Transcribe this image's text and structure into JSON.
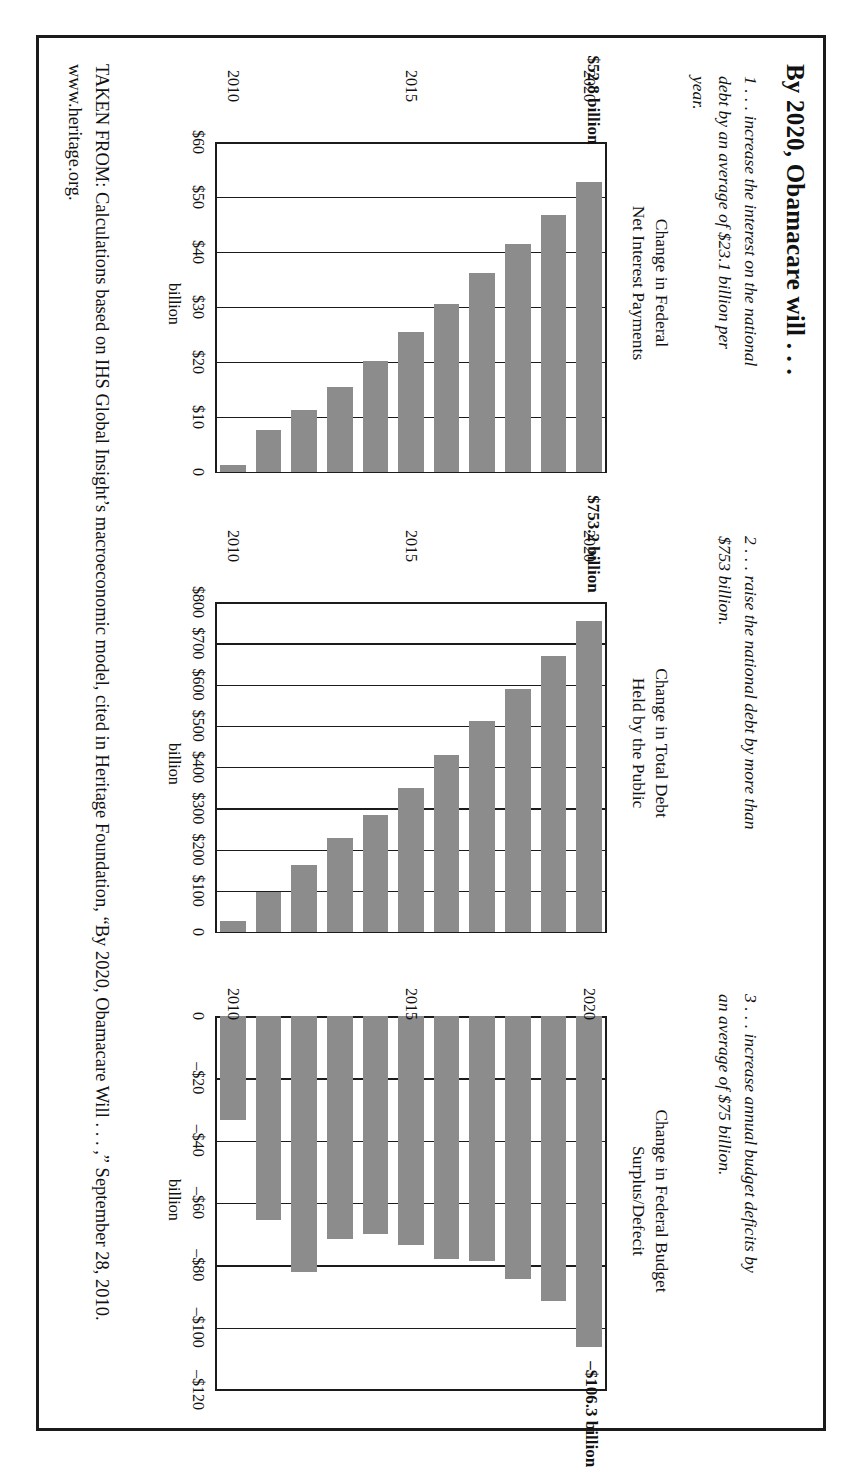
{
  "document": {
    "title": "By 2020, Obamacare will . . .",
    "claims": [
      "1 . . . increase the interest on the national debt by an average of $23.1 billion per year.",
      "2 . . . raise the national debt by more than $753 billion.",
      "3 . . . increase annual budget deficits by an average of $75 billion."
    ],
    "source": "TAKEN FROM: Calculations based on IHS Global Insight’s macroeconomic model, cited in Heritage Foundation, “By 2020, Obamacare Will . . . ,” September 28, 2010. www.heritage.org."
  },
  "chart_data": [
    {
      "id": "chart-1",
      "type": "bar",
      "orientation": "vertical",
      "title": "Change in Federal\nNet Interest Payments",
      "title_line1": "Change in Federal",
      "title_line2": "Net Interest Payments",
      "annotation": "$52.8 billion",
      "ylabel": "billion",
      "xlabel": "",
      "categories": [
        "2010",
        "2011",
        "2012",
        "2013",
        "2014",
        "2015",
        "2016",
        "2017",
        "2018",
        "2019",
        "2020"
      ],
      "xtick_labels": [
        "2010",
        "2015",
        "2020"
      ],
      "ytick_labels": [
        "$60",
        "$50",
        "$40",
        "$30",
        "$20",
        "$10",
        "0"
      ],
      "ytick_values": [
        60,
        50,
        40,
        30,
        20,
        10,
        0
      ],
      "ylim": [
        0,
        60
      ],
      "grid": true,
      "values": [
        1.2,
        7.6,
        11.3,
        15.4,
        20.1,
        25.4,
        30.6,
        36.2,
        41.5,
        46.8,
        52.8
      ]
    },
    {
      "id": "chart-2",
      "type": "bar",
      "orientation": "vertical",
      "title": "Change in Total Debt\nHeld by the Public",
      "title_line1": "Change in Total Debt",
      "title_line2": "Held by the Public",
      "annotation": "$753.2 billion",
      "ylabel": "billion",
      "xlabel": "",
      "categories": [
        "2010",
        "2011",
        "2012",
        "2013",
        "2014",
        "2015",
        "2016",
        "2017",
        "2018",
        "2019",
        "2020"
      ],
      "xtick_labels": [
        "2010",
        "2015",
        "2020"
      ],
      "ytick_labels": [
        "$800",
        "$700",
        "$600",
        "$500",
        "$400",
        "$300",
        "$200",
        "$100",
        "0"
      ],
      "ytick_values": [
        800,
        700,
        600,
        500,
        400,
        300,
        200,
        100,
        0
      ],
      "ylim": [
        0,
        800
      ],
      "grid": true,
      "values": [
        26,
        96,
        163,
        228,
        283,
        348,
        428,
        512,
        590,
        668,
        753.2
      ]
    },
    {
      "id": "chart-3",
      "type": "bar",
      "orientation": "vertical",
      "title": "Change in Federal Budget\nSurplus/Defecit",
      "title_line1": "Change in Federal Budget",
      "title_line2": "Surplus/Defecit",
      "annotation": "–$106.3 billion",
      "ylabel": "billion",
      "xlabel": "",
      "categories": [
        "2010",
        "2011",
        "2012",
        "2013",
        "2014",
        "2015",
        "2016",
        "2017",
        "2018",
        "2019",
        "2020"
      ],
      "xtick_labels": [
        "2010",
        "2015",
        "2020"
      ],
      "ytick_labels": [
        "0",
        "–$20",
        "–$40",
        "–$60",
        "–$80",
        "–$100",
        "–$120"
      ],
      "ytick_values": [
        0,
        -20,
        -40,
        -60,
        -80,
        -100,
        -120
      ],
      "ylim": [
        -120,
        0
      ],
      "grid": true,
      "values": [
        -33.5,
        -65.5,
        -82.0,
        -71.5,
        -70.0,
        -73.5,
        -78.0,
        -78.5,
        -84.5,
        -91.5,
        -106.3
      ]
    }
  ],
  "style": {
    "bar_color": "#8c8c8c",
    "axis_color": "#1b1b1b",
    "background": "#ffffff"
  }
}
